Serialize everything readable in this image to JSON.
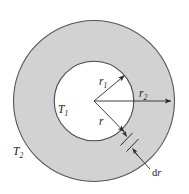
{
  "figure": {
    "kind": "cross-section-annulus-heat-conduction",
    "background_color": "#ffffff",
    "shell_fill_color": "#d2d2d2",
    "core_fill_color": "#ffffff",
    "stroke_color": "#4a4a4a",
    "line_color": "#2b2b2b",
    "text_color": "#1a1a1a"
  },
  "geometry": {
    "center_x": 94,
    "center_y": 101,
    "outer_radius": 81,
    "inner_radius": 40
  },
  "labels": {
    "inner_temperature": {
      "base": "T",
      "sub": "1"
    },
    "outer_temperature": {
      "base": "T",
      "sub": "2"
    },
    "inner_radius": {
      "base": "r",
      "sub": "1"
    },
    "outer_radius": {
      "base": "r",
      "sub": "2"
    },
    "variable_radius": {
      "base": "r",
      "sub": ""
    },
    "differential_thickness": {
      "prefix": "d",
      "base": "r"
    }
  },
  "annotations": [
    {
      "name": "inner-radius-arrow",
      "label": "r1",
      "from": [
        94,
        101
      ],
      "to": [
        127,
        73
      ],
      "note": "arrow from center to inner circle edge, up-right"
    },
    {
      "name": "outer-radius-arrow",
      "label": "r2",
      "from": [
        94,
        101
      ],
      "to": [
        174,
        101
      ],
      "note": "horizontal arrow from center to outer circle edge"
    },
    {
      "name": "variable-radius-arrow",
      "label": "r",
      "from": [
        94,
        101
      ],
      "to": [
        126,
        133
      ],
      "note": "arrow from center to shell element, down-right"
    },
    {
      "name": "thickness-leader",
      "label": "dr",
      "from": [
        152,
        170
      ],
      "to": [
        128,
        142
      ],
      "note": "leader line from dr text to the differential shell element"
    }
  ]
}
